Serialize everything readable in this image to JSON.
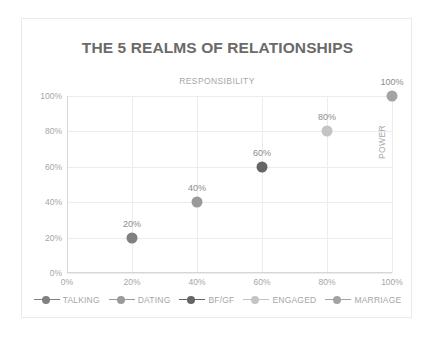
{
  "chart_data": {
    "type": "scatter",
    "title": "THE 5 REALMS OF RELATIONSHIPS",
    "xlabel": "RESPONSIBILITY",
    "ylabel": "POWER",
    "xlim": [
      0,
      100
    ],
    "ylim": [
      0,
      100
    ],
    "grid": true,
    "legend_position": "bottom",
    "x_ticks": [
      "0%",
      "20%",
      "40%",
      "60%",
      "80%",
      "100%"
    ],
    "y_ticks": [
      "0%",
      "20%",
      "40%",
      "60%",
      "80%",
      "100%"
    ],
    "x_tick_values": [
      0,
      20,
      40,
      60,
      80,
      100
    ],
    "y_tick_values": [
      0,
      20,
      40,
      60,
      80,
      100
    ],
    "series": [
      {
        "name": "TALKING",
        "x": [
          20
        ],
        "y": [
          20
        ],
        "labels": [
          "20%"
        ],
        "color": "#808080"
      },
      {
        "name": "DATING",
        "x": [
          40
        ],
        "y": [
          40
        ],
        "labels": [
          "40%"
        ],
        "color": "#9a9a9a"
      },
      {
        "name": "BF/GF",
        "x": [
          60
        ],
        "y": [
          60
        ],
        "labels": [
          "60%"
        ],
        "color": "#666666"
      },
      {
        "name": "ENGAGED",
        "x": [
          80
        ],
        "y": [
          80
        ],
        "labels": [
          "80%"
        ],
        "color": "#c4c4c4"
      },
      {
        "name": "MARRIAGE",
        "x": [
          100
        ],
        "y": [
          100
        ],
        "labels": [
          "100%"
        ],
        "color": "#a3a3a3"
      }
    ]
  },
  "colors": {
    "title": "#6a6a6a",
    "axis_text": "#a6a6a6",
    "gridline": "#ececec",
    "axis_line": "#d6d6d6",
    "frame_border": "#eaeaea",
    "data_label": "#8c8c8c",
    "background": "#ffffff"
  }
}
